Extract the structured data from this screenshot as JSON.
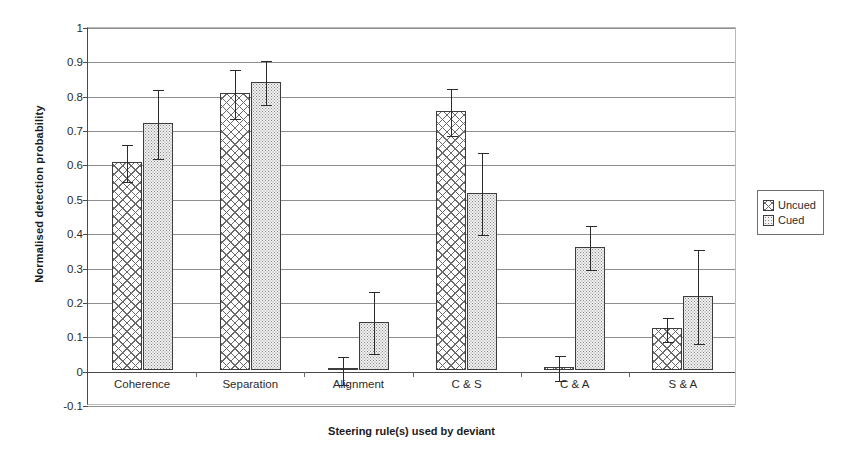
{
  "chart_data": {
    "type": "bar",
    "title": "",
    "xlabel": "Steering rule(s) used by deviant",
    "ylabel": "Normalised detection probability",
    "categories": [
      "Coherence",
      "Separation",
      "Alignment",
      "C & S",
      "C & A",
      "S & A"
    ],
    "ylim": [
      -0.1,
      1
    ],
    "ytick_labels": [
      "1",
      "0.9",
      "0.8",
      "0.7",
      "0.6",
      "0.5",
      "0.4",
      "0.3",
      "0.2",
      "0.1",
      "0",
      "-0.1"
    ],
    "ytick_values": [
      1,
      0.9,
      0.8,
      0.7,
      0.6,
      0.5,
      0.4,
      0.3,
      0.2,
      0.1,
      0,
      -0.1
    ],
    "grid": true,
    "legend_position": "right",
    "series": [
      {
        "name": "Uncued",
        "pattern": "crosshatch",
        "values": [
          0.605,
          0.805,
          0.0,
          0.752,
          0.008,
          0.12
        ],
        "errors": [
          0.055,
          0.072,
          0.042,
          0.07,
          0.037,
          0.036
        ]
      },
      {
        "name": "Cued",
        "pattern": "dotted",
        "values": [
          0.718,
          0.838,
          0.14,
          0.515,
          0.358,
          0.215
        ],
        "errors": [
          0.103,
          0.065,
          0.092,
          0.12,
          0.065,
          0.138
        ]
      }
    ]
  },
  "legend": {
    "items": [
      {
        "label": "Uncued"
      },
      {
        "label": "Cued"
      }
    ]
  }
}
